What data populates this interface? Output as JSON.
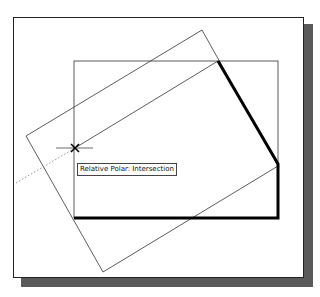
{
  "drawing": {
    "tooltip_text": "Relative Polar: Intersection",
    "cursor": "crosshair-icon",
    "snap_marker": "intersection-x-marker",
    "colors": {
      "background": "#ffffff",
      "frame_border": "#222222",
      "shadow": "#5a5a5a",
      "thin_line": "#333333",
      "thick_line": "#000000",
      "tracking_line": "#777777"
    }
  }
}
